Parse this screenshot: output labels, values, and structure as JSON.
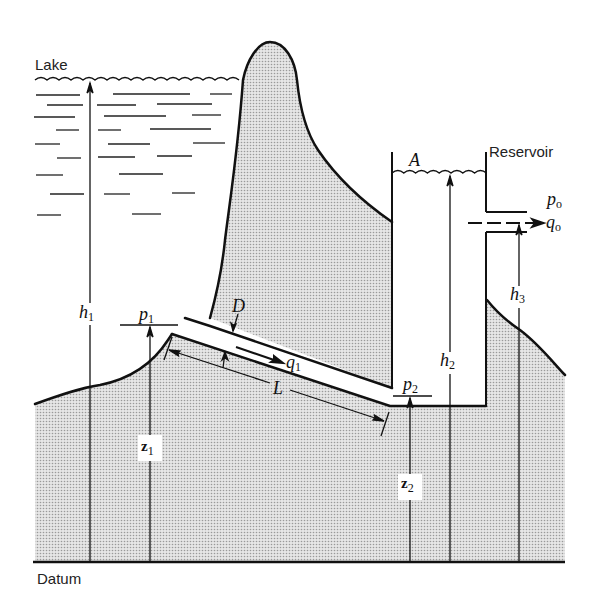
{
  "figure": {
    "type": "hydraulic schematic"
  },
  "labels": {
    "lake": "Lake",
    "reservoir": "Reservoir",
    "datum": "Datum",
    "area": "A",
    "diameter": "D",
    "length": "L",
    "p1": {
      "base": "p",
      "sub": "1"
    },
    "p2": {
      "base": "p",
      "sub": "2"
    },
    "po": {
      "base": "p",
      "sub": "o"
    },
    "q1": {
      "base": "q",
      "sub": "1"
    },
    "qo": {
      "base": "q",
      "sub": "o"
    },
    "h1": {
      "base": "h",
      "sub": "1"
    },
    "h2": {
      "base": "h",
      "sub": "2"
    },
    "h3": {
      "base": "h",
      "sub": "3"
    },
    "z1": {
      "base": "z",
      "sub": "1"
    },
    "z2": {
      "base": "z",
      "sub": "2"
    }
  },
  "colors": {
    "ink": "#111111",
    "ground_fill": "#d4d4d4",
    "background": "#ffffff"
  }
}
